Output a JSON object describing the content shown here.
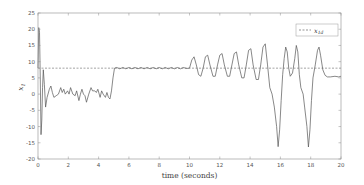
{
  "chart_data": {
    "type": "line",
    "title": "",
    "xlabel": "time (seconds)",
    "ylabel": "x_1",
    "ylabel_main": "x",
    "ylabel_sub": "1",
    "xlim": [
      0,
      20
    ],
    "ylim": [
      -20,
      25
    ],
    "xticks": [
      0,
      2,
      4,
      6,
      8,
      10,
      12,
      14,
      16,
      18,
      20
    ],
    "yticks": [
      -20,
      -15,
      -10,
      -5,
      0,
      5,
      10,
      15,
      20,
      25
    ],
    "grid": false,
    "legend": {
      "position": "upper right",
      "entries": [
        {
          "label": "x_1d",
          "main": "x",
          "sub": "1d",
          "style": "dashed"
        }
      ]
    },
    "series": [
      {
        "name": "x_1",
        "style": "solid",
        "color": "#555555",
        "points": [
          [
            0.0,
            8
          ],
          [
            0.05,
            20.5
          ],
          [
            0.1,
            19
          ],
          [
            0.15,
            5
          ],
          [
            0.2,
            -12.5
          ],
          [
            0.25,
            -8
          ],
          [
            0.3,
            2
          ],
          [
            0.35,
            7.5
          ],
          [
            0.42,
            3
          ],
          [
            0.5,
            -4
          ],
          [
            0.6,
            -1
          ],
          [
            0.75,
            1.5
          ],
          [
            0.85,
            2.5
          ],
          [
            0.95,
            0.5
          ],
          [
            1.05,
            -1
          ],
          [
            1.2,
            -0.5
          ],
          [
            1.35,
            0
          ],
          [
            1.5,
            2
          ],
          [
            1.6,
            0.5
          ],
          [
            1.7,
            1.5
          ],
          [
            1.8,
            0
          ],
          [
            1.95,
            1
          ],
          [
            2.05,
            0
          ],
          [
            2.15,
            2
          ],
          [
            2.3,
            0
          ],
          [
            2.45,
            -0.5
          ],
          [
            2.55,
            1
          ],
          [
            2.7,
            -2
          ],
          [
            2.8,
            0
          ],
          [
            2.9,
            1.5
          ],
          [
            3.0,
            0
          ],
          [
            3.1,
            -0.5
          ],
          [
            3.2,
            -2.5
          ],
          [
            3.35,
            0
          ],
          [
            3.5,
            2
          ],
          [
            3.6,
            1
          ],
          [
            3.75,
            1
          ],
          [
            3.85,
            0.5
          ],
          [
            3.95,
            1.5
          ],
          [
            4.1,
            -1
          ],
          [
            4.2,
            1
          ],
          [
            4.3,
            0
          ],
          [
            4.45,
            -1
          ],
          [
            4.55,
            0.5
          ],
          [
            4.65,
            -1
          ],
          [
            4.75,
            -1.5
          ],
          [
            4.85,
            1
          ],
          [
            4.95,
            5
          ],
          [
            5.05,
            8
          ],
          [
            5.2,
            8.2
          ],
          [
            5.4,
            7.8
          ],
          [
            5.6,
            8.2
          ],
          [
            5.8,
            7.8
          ],
          [
            6.0,
            8.2
          ],
          [
            6.2,
            7.8
          ],
          [
            6.4,
            8.2
          ],
          [
            6.6,
            7.8
          ],
          [
            6.8,
            8.2
          ],
          [
            7.0,
            7.8
          ],
          [
            7.2,
            8.2
          ],
          [
            7.4,
            7.8
          ],
          [
            7.6,
            8.2
          ],
          [
            7.8,
            7.8
          ],
          [
            8.0,
            8.2
          ],
          [
            8.2,
            7.8
          ],
          [
            8.4,
            8.2
          ],
          [
            8.6,
            7.8
          ],
          [
            8.8,
            8.2
          ],
          [
            9.0,
            7.8
          ],
          [
            9.2,
            8.2
          ],
          [
            9.4,
            7.8
          ],
          [
            9.6,
            8.2
          ],
          [
            9.8,
            7.9
          ],
          [
            10.0,
            8
          ],
          [
            10.15,
            10.5
          ],
          [
            10.3,
            11.5
          ],
          [
            10.45,
            9
          ],
          [
            10.6,
            6
          ],
          [
            10.75,
            5.5
          ],
          [
            10.9,
            8
          ],
          [
            11.05,
            11.5
          ],
          [
            11.2,
            12
          ],
          [
            11.35,
            9
          ],
          [
            11.55,
            5.5
          ],
          [
            11.7,
            5.5
          ],
          [
            11.85,
            9
          ],
          [
            12.0,
            12
          ],
          [
            12.15,
            12.5
          ],
          [
            12.3,
            9
          ],
          [
            12.5,
            5.5
          ],
          [
            12.65,
            5.5
          ],
          [
            12.8,
            9
          ],
          [
            12.95,
            12.5
          ],
          [
            13.1,
            13
          ],
          [
            13.25,
            9
          ],
          [
            13.45,
            5
          ],
          [
            13.6,
            5
          ],
          [
            13.75,
            9
          ],
          [
            13.9,
            13.5
          ],
          [
            14.05,
            14
          ],
          [
            14.2,
            9
          ],
          [
            14.4,
            4.5
          ],
          [
            14.55,
            4.5
          ],
          [
            14.7,
            9
          ],
          [
            14.85,
            14.5
          ],
          [
            15.0,
            15.5
          ],
          [
            15.15,
            9
          ],
          [
            15.3,
            2
          ],
          [
            15.45,
            0
          ],
          [
            15.6,
            -4
          ],
          [
            15.75,
            -10
          ],
          [
            15.85,
            -16.2
          ],
          [
            15.95,
            -11
          ],
          [
            16.05,
            -2
          ],
          [
            16.15,
            6
          ],
          [
            16.25,
            11
          ],
          [
            16.35,
            14.5
          ],
          [
            16.45,
            13
          ],
          [
            16.55,
            8
          ],
          [
            16.65,
            5.5
          ],
          [
            16.8,
            6.5
          ],
          [
            16.95,
            11
          ],
          [
            17.05,
            15
          ],
          [
            17.15,
            13
          ],
          [
            17.25,
            6
          ],
          [
            17.35,
            2
          ],
          [
            17.5,
            0
          ],
          [
            17.6,
            -4
          ],
          [
            17.75,
            -10
          ],
          [
            17.85,
            -16.3
          ],
          [
            17.95,
            -11
          ],
          [
            18.05,
            -2
          ],
          [
            18.15,
            5
          ],
          [
            18.3,
            9
          ],
          [
            18.45,
            13.5
          ],
          [
            18.55,
            14.5
          ],
          [
            18.65,
            12
          ],
          [
            18.8,
            7.5
          ],
          [
            18.95,
            5.8
          ],
          [
            19.1,
            5.3
          ],
          [
            19.3,
            5.3
          ],
          [
            19.6,
            5.5
          ],
          [
            19.85,
            5.3
          ],
          [
            20.0,
            5.5
          ]
        ]
      },
      {
        "name": "x_1d",
        "style": "dashed",
        "color": "#666666",
        "points": [
          [
            0,
            8
          ],
          [
            20,
            8
          ]
        ]
      }
    ]
  }
}
